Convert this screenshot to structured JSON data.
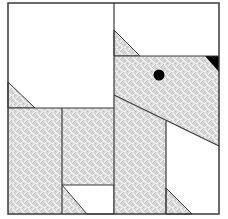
{
  "figure": {
    "colors": {
      "background": "#ffffff",
      "outline": "#3a3a3a",
      "hatch_base": "#d4d4d4",
      "hatch_light": "#f2f2f2",
      "hatch_dark": "#9a9a9a",
      "eye": "#000000",
      "nose": "#000000"
    },
    "shapes": {
      "frame": {
        "x": 8,
        "y": 3,
        "w": 211,
        "h": 211
      },
      "eye": {
        "cx": 159,
        "cy": 75,
        "r": 5.5
      }
    }
  }
}
